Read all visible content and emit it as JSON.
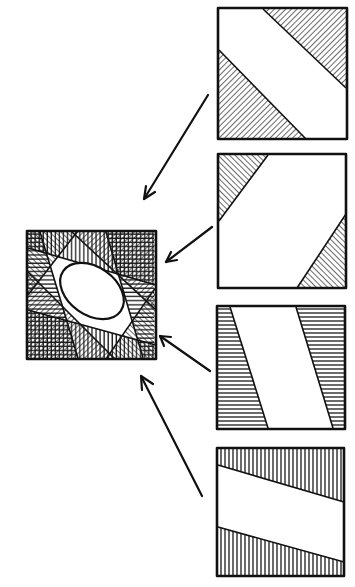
{
  "figure": {
    "title": "",
    "ink_color": "#111111",
    "paper_color": "#ffffff",
    "panels": [
      {
        "id": "panel-1",
        "hatch": "diagonal-down",
        "shapes": "upper-right and lower-left triangles"
      },
      {
        "id": "panel-2",
        "hatch": "diagonal-up",
        "shapes": "upper-left and lower-right triangles"
      },
      {
        "id": "panel-3",
        "hatch": "horizontal",
        "shapes": "left and right slanted trapezoids"
      },
      {
        "id": "panel-4",
        "hatch": "vertical",
        "shapes": "top and bottom slanted bands"
      }
    ],
    "composite": {
      "id": "composite",
      "hatch": "superposition of all panels",
      "opening": "ellipse"
    },
    "arrows": [
      {
        "from": "panel-1",
        "to": "composite"
      },
      {
        "from": "panel-2",
        "to": "composite"
      },
      {
        "from": "panel-3",
        "to": "composite"
      },
      {
        "from": "panel-4",
        "to": "composite"
      }
    ]
  }
}
